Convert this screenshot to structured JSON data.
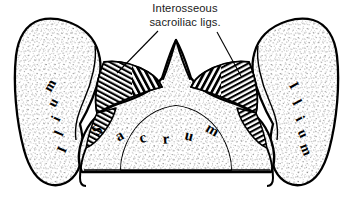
{
  "figure": {
    "name": "cross-section-sacroiliac-joint",
    "background_color": "#ffffff",
    "ink_color": "#000000"
  },
  "callout": {
    "line1": "Interosseous",
    "line2": "sacroiliac ligs.",
    "leaders": [
      {
        "name": "leader-line-left",
        "x1": 158,
        "y1": 31,
        "x2": 117,
        "y2": 73
      },
      {
        "name": "leader-line-right",
        "x1": 217,
        "y1": 32,
        "x2": 241,
        "y2": 76
      }
    ]
  },
  "labels": {
    "sacrum": {
      "text": "Sacrum",
      "letters": [
        {
          "char": "S",
          "x": 98,
          "y": 131,
          "rot": -42
        },
        {
          "char": "a",
          "x": 120,
          "y": 137,
          "rot": -30
        },
        {
          "char": "c",
          "x": 143,
          "y": 139,
          "rot": -16
        },
        {
          "char": "r",
          "x": 166,
          "y": 140,
          "rot": -4
        },
        {
          "char": "u",
          "x": 189,
          "y": 137,
          "rot": 14
        },
        {
          "char": "m",
          "x": 212,
          "y": 131,
          "rot": 30
        }
      ]
    },
    "ilium_left": {
      "text": "Ilium",
      "letters": [
        {
          "char": "I",
          "x": 63,
          "y": 150,
          "rot": -68
        },
        {
          "char": "l",
          "x": 60,
          "y": 134,
          "rot": -66
        },
        {
          "char": "i",
          "x": 57,
          "y": 119,
          "rot": -64
        },
        {
          "char": "u",
          "x": 54,
          "y": 103,
          "rot": -62
        },
        {
          "char": "m",
          "x": 51,
          "y": 86,
          "rot": -60
        }
      ]
    },
    "ilium_right": {
      "text": "Ilium",
      "letters": [
        {
          "char": "I",
          "x": 293,
          "y": 86,
          "rot": 60
        },
        {
          "char": "l",
          "x": 296,
          "y": 103,
          "rot": 62
        },
        {
          "char": "i",
          "x": 299,
          "y": 119,
          "rot": 64
        },
        {
          "char": "u",
          "x": 302,
          "y": 134,
          "rot": 66
        },
        {
          "char": "m",
          "x": 305,
          "y": 150,
          "rot": 68
        }
      ]
    }
  }
}
